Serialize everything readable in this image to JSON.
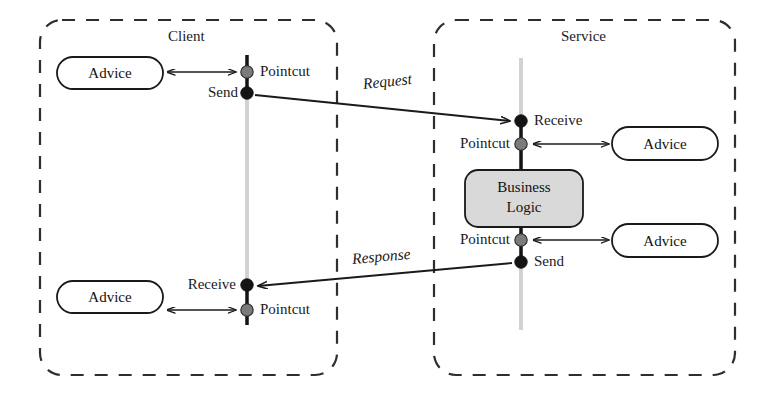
{
  "diagram": {
    "title": "",
    "colors": {
      "stroke": "#1a1a1a",
      "lifeline_inactive": "#cfcfcf",
      "lifeline_active": "#111111",
      "pointcut_dot": "#777777",
      "endpoint_dot": "#111111",
      "business_logic_fill": "#d9d9d9",
      "advice_fill": "#ffffff",
      "dashed_border": "#333333",
      "background": "#ffffff"
    },
    "containers": [
      {
        "id": "client",
        "label": "Client",
        "x": 40,
        "y": 20,
        "width": 297,
        "height": 355
      },
      {
        "id": "service",
        "label": "Service",
        "x": 434,
        "y": 20,
        "width": 301,
        "height": 355
      }
    ],
    "lifelines": [
      {
        "id": "client-lifeline",
        "x": 247,
        "top": 55,
        "bottom": 325
      },
      {
        "id": "service-lifeline",
        "x": 521,
        "top": 58,
        "bottom": 330
      }
    ],
    "nodes": [
      {
        "id": "advice-client-send",
        "label": "Advice",
        "x": 57,
        "y": 57,
        "width": 106,
        "height": 32,
        "fill": "#ffffff"
      },
      {
        "id": "advice-client-receive",
        "label": "Advice",
        "x": 57,
        "y": 281,
        "width": 106,
        "height": 32,
        "fill": "#ffffff"
      },
      {
        "id": "advice-service-receive",
        "label": "Advice",
        "x": 612,
        "y": 127,
        "width": 106,
        "height": 33,
        "fill": "#ffffff"
      },
      {
        "id": "advice-service-send",
        "label": "Advice",
        "x": 612,
        "y": 224,
        "width": 106,
        "height": 33,
        "fill": "#ffffff"
      },
      {
        "id": "business-logic",
        "label": "Business\nLogic",
        "line1": "Business",
        "line2": "Logic",
        "x": 465,
        "y": 170,
        "width": 118,
        "height": 57,
        "fill": "#d9d9d9"
      }
    ],
    "joinpoints": [
      {
        "id": "client-pointcut-send",
        "label": "Pointcut",
        "type": "pointcut",
        "x": 247,
        "y": 72,
        "label_x": 260,
        "label_y": 65,
        "align": "left"
      },
      {
        "id": "client-send",
        "label": "Send",
        "type": "endpoint",
        "x": 247,
        "y": 93,
        "label_x": 240,
        "label_y": 86,
        "align": "right"
      },
      {
        "id": "service-receive",
        "label": "Receive",
        "type": "endpoint",
        "x": 521,
        "y": 121,
        "label_x": 534,
        "label_y": 114,
        "align": "left"
      },
      {
        "id": "service-pointcut-receive",
        "label": "Pointcut",
        "type": "pointcut",
        "x": 521,
        "y": 144,
        "label_x": 513,
        "label_y": 137,
        "align": "right"
      },
      {
        "id": "service-pointcut-send",
        "label": "Pointcut",
        "type": "pointcut",
        "x": 521,
        "y": 240,
        "label_x": 513,
        "label_y": 233,
        "align": "right"
      },
      {
        "id": "service-send",
        "label": "Send",
        "type": "endpoint",
        "x": 521,
        "y": 262,
        "label_x": 534,
        "label_y": 255,
        "align": "left"
      },
      {
        "id": "client-receive",
        "label": "Receive",
        "type": "endpoint",
        "x": 247,
        "y": 285,
        "label_x": 239,
        "label_y": 278,
        "align": "right"
      },
      {
        "id": "client-pointcut-receive",
        "label": "Pointcut",
        "type": "pointcut",
        "x": 247,
        "y": 310,
        "label_x": 260,
        "label_y": 303,
        "align": "left"
      }
    ],
    "messages": [
      {
        "id": "request",
        "label": "Request",
        "from": "client-send",
        "to": "service-receive",
        "x1": 254,
        "y1": 95,
        "x2": 512,
        "y2": 122,
        "label_x": 363,
        "label_y": 83,
        "rotation": -6
      },
      {
        "id": "response",
        "label": "Response",
        "from": "service-send",
        "to": "client-receive",
        "x1": 513,
        "y1": 263,
        "x2": 256,
        "y2": 286,
        "label_x": 352,
        "label_y": 257,
        "rotation": -5
      }
    ],
    "advice_links": [
      {
        "id": "link-client-pointcut-send",
        "x1": 165,
        "y1": 72,
        "x2": 238,
        "y2": 72,
        "double": true
      },
      {
        "id": "link-client-pointcut-receive",
        "x1": 165,
        "y1": 310,
        "x2": 238,
        "y2": 310,
        "double": true
      },
      {
        "id": "link-service-pointcut-receive",
        "x1": 531,
        "y1": 144,
        "x2": 608,
        "y2": 144,
        "double": true
      },
      {
        "id": "link-service-pointcut-send",
        "x1": 531,
        "y1": 240,
        "x2": 608,
        "y2": 240,
        "double": true
      }
    ]
  }
}
